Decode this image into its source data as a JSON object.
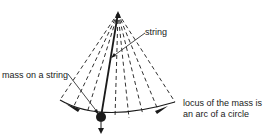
{
  "diagram": {
    "labels": {
      "string": "string",
      "mass": "mass on a string",
      "locus_line1": "locus of the mass is",
      "locus_line2": "an arc of a circle"
    },
    "geometry": {
      "pivot": [
        118,
        13
      ],
      "mass": [
        101,
        117
      ],
      "arc_left": [
        60,
        100
      ],
      "arc_right": [
        175,
        102
      ],
      "dashed_line_count": 8
    },
    "colors": {
      "ink": "#1a1a1a",
      "background": "#ffffff"
    }
  }
}
